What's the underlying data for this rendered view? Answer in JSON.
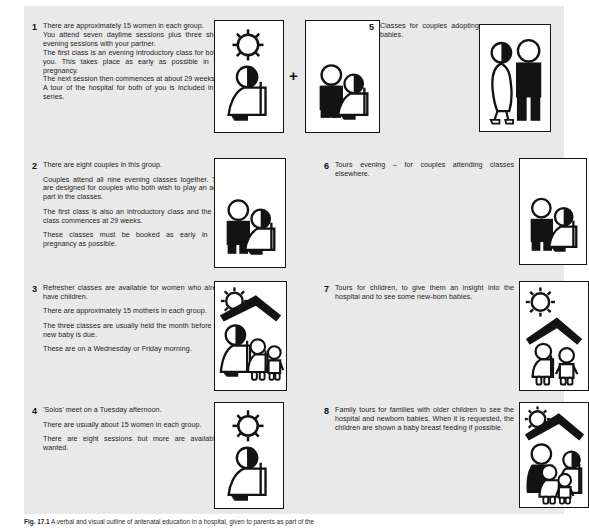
{
  "figure": {
    "caption_label": "Fig. 17.1",
    "caption_text": "A verbal and visual outline of antenatal education in a hospital, given to parents as part of the"
  },
  "plus_symbol": "+",
  "entries": [
    {
      "number": "1",
      "paragraphs": [
        "There are approximately 15 women in each group.",
        "You attend seven daytime sessions plus three shared evening sessions with your partner.",
        "The first class is an evening introductory class for both of you. This takes place as early as possible in your pregnancy.",
        "The next session then commences at about 29 weeks.",
        "A tour of the hospital for both of you is included in this series."
      ],
      "art": [
        "sun-and-pregnant-woman",
        "moon-and-couple"
      ]
    },
    {
      "number": "2",
      "paragraphs": [
        "There are eight couples in this group.",
        "Couples attend all nine evening classes together. They are designed for couples who both wish to play an active part in the classes.",
        "The first class is also an introductory class and the next class commences at 29 weeks.",
        "These classes must be booked as early in your pregnancy as possible."
      ],
      "art": [
        "moon-and-couple"
      ]
    },
    {
      "number": "3",
      "paragraphs": [
        "Refresher classes are available for women who already have children.",
        "There are approximately 15 mothers in each group.",
        "The three classes are usually held the month before your new baby is due.",
        "These are on a Wednesday or Friday morning."
      ],
      "art": [
        "sun-house-mother-and-children"
      ]
    },
    {
      "number": "4",
      "paragraphs": [
        "'Solos' meet on a Tuesday afternoon.",
        "There are usually about 15 women in each group.",
        "There are eight sessions but more are available if wanted."
      ],
      "art": [
        "sun-and-pregnant-woman"
      ]
    },
    {
      "number": "5",
      "paragraphs": [
        "Classes for couples adopting babies."
      ],
      "art": [
        "adopting-couple"
      ]
    },
    {
      "number": "6",
      "paragraphs": [
        "Tours evening – for couples attending classes elsewhere."
      ],
      "art": [
        "moon-and-couple"
      ]
    },
    {
      "number": "7",
      "paragraphs": [
        "Tours for children, to give them an insight into the hospital and to see some new-born babies."
      ],
      "art": [
        "sun-house-two-children"
      ]
    },
    {
      "number": "8",
      "paragraphs": [
        "Family tours for families with older children to see the hospital and newborn babies. When it is requested, the children are shown a baby breast feeding if possible."
      ],
      "art": [
        "sun-house-family"
      ]
    }
  ],
  "colors": {
    "plate_background": "#e9e9e9",
    "ink": "#131313",
    "paper": "#ffffff"
  }
}
